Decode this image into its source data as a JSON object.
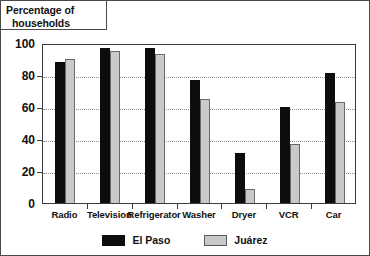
{
  "chart_data": {
    "type": "bar",
    "title": "Percentage of households",
    "title_line1": "Percentage of",
    "title_line2": "households",
    "xlabel": "",
    "ylabel": "",
    "ylim": [
      0,
      100
    ],
    "yticks": [
      0,
      20,
      40,
      60,
      80,
      100
    ],
    "ytick_labels": [
      "0",
      "20",
      "40",
      "60",
      "80",
      "100"
    ],
    "grid": "horizontal-dotted",
    "legend_position": "bottom-center",
    "categories": [
      "Radio",
      "Television",
      "Refrigerator",
      "Washer",
      "Dryer",
      "VCR",
      "Car"
    ],
    "series": [
      {
        "name": "El Paso",
        "color": "#0d0d0d",
        "values": [
          88,
          97,
          97,
          77,
          31,
          60,
          81
        ]
      },
      {
        "name": "Juárez",
        "color": "#c9c9c9",
        "values": [
          90,
          95,
          93,
          65,
          9,
          37,
          63
        ]
      }
    ]
  },
  "legend": {
    "items": [
      {
        "label": "El Paso",
        "swatch": "black-swatch"
      },
      {
        "label": "Juárez",
        "swatch": "gray-swatch"
      }
    ]
  }
}
